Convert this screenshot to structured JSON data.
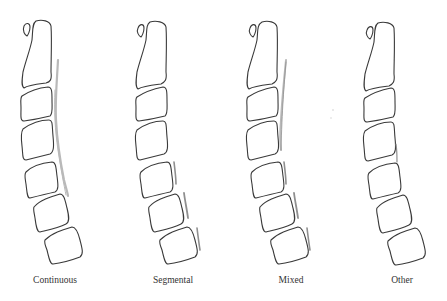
{
  "figure": {
    "panels": [
      {
        "id": "continuous",
        "label": "Continuous",
        "label_x": 55
      },
      {
        "id": "segmental",
        "label": "Segmental",
        "label_x": 173
      },
      {
        "id": "mixed",
        "label": "Mixed",
        "label_x": 291
      },
      {
        "id": "other",
        "label": "Other",
        "label_x": 402
      }
    ],
    "colors": {
      "outline": "#3a3a3a",
      "ossification": "#b9b9b9",
      "background": "#ffffff"
    }
  }
}
